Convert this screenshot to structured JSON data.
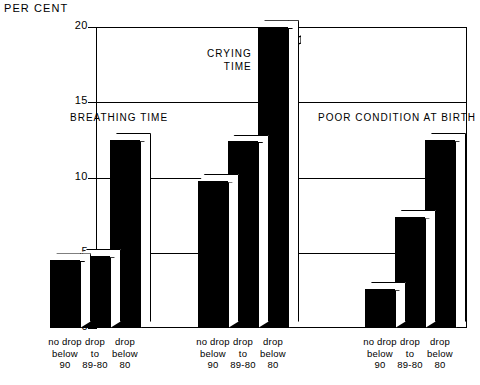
{
  "chart_data": {
    "type": "bar",
    "title": "",
    "ylabel": "PER CENT",
    "xlabel": "",
    "ylim": [
      0,
      20
    ],
    "yticks": [
      0,
      5,
      10,
      15,
      20
    ],
    "ytick_labels": [
      "0",
      "5",
      "10",
      "15",
      "20"
    ],
    "grid": true,
    "grid_axis": "y",
    "legend": "none",
    "categories": [
      "no drop below 90",
      "drop to 89-80",
      "drop below 80"
    ],
    "groups": [
      {
        "name": "BREATHING TIME",
        "label_line1": "BREATHING TIME",
        "label_line2": "",
        "values": [
          4.5,
          4.8,
          12.5
        ],
        "broken": [
          false,
          false,
          false
        ]
      },
      {
        "name": "CRYING TIME",
        "label_line1": "CRYING",
        "label_line2": "TIME",
        "values": [
          9.8,
          12.4,
          20.0
        ],
        "broken": [
          false,
          false,
          true
        ],
        "note": "third bar is drawn with an axis-break symbol; its true value exceeds 20 per cent"
      },
      {
        "name": "POOR CONDITION AT BIRTH",
        "label_line1": "POOR CONDITION AT BIRTH",
        "label_line2": "",
        "values": [
          2.6,
          7.4,
          12.5
        ],
        "broken": [
          false,
          false,
          false
        ]
      }
    ],
    "xcat_lines": [
      [
        "no drop",
        "below",
        "90"
      ],
      [
        "drop",
        "to",
        "89-80"
      ],
      [
        "drop",
        "below",
        "80"
      ]
    ],
    "colors": {
      "bar_face": "#000000",
      "bar_top": "#ffffff",
      "bar_side": "#ffffff",
      "axis": "#000000",
      "background": "#ffffff"
    }
  }
}
